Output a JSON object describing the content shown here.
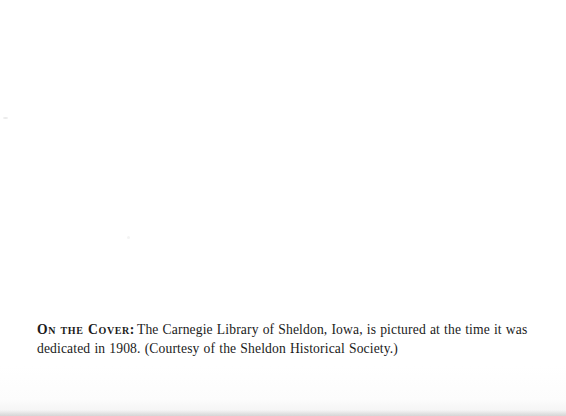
{
  "page": {
    "background_color": "#ffffff",
    "text_color": "#1b1b1b",
    "width": 566,
    "height": 416
  },
  "caption": {
    "lead_label": "On the Cover:",
    "body_text": "The Carnegie Library of Sheldon, Iowa, is pictured at the time it was dedicated in 1908. (Courtesy of the Sheldon Historical Society.)",
    "full_text": "On the Cover: The Carnegie Library of Sheldon, Iowa, is pictured at the time it was dedicated in 1908. (Courtesy of the Sheldon Historical Society.)",
    "lines": [
      "On the Cover: The Carnegie Library of Sheldon, Iowa, is pictured at the time it was dedicated",
      "in 1908. (Courtesy of the Sheldon Historical Society.)"
    ]
  }
}
